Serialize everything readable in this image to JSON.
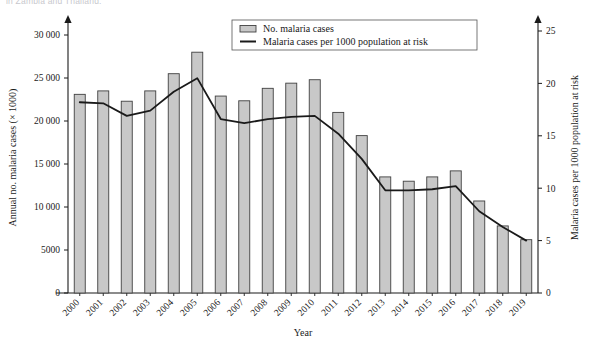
{
  "figure": {
    "cutoff_caption": "in Zambia and Thailand."
  },
  "chart_data": {
    "type": "bar",
    "title": "",
    "xlabel": "Year",
    "ylabel": "Annual no. malaria cases (× 1000)",
    "y2label": "Malaria cases per 1000 population at risk",
    "grid": false,
    "legend_position": "top-center",
    "categories": [
      "2000",
      "2001",
      "2002",
      "2003",
      "2004",
      "2005",
      "2006",
      "2007",
      "2008",
      "2009",
      "2010",
      "2011",
      "2012",
      "2013",
      "2014",
      "2015",
      "2016",
      "2017",
      "2018",
      "2019"
    ],
    "ylim": [
      0,
      30000
    ],
    "yticks": [
      0,
      5000,
      10000,
      15000,
      20000,
      25000,
      30000
    ],
    "ytick_labels": [
      "0",
      "5000",
      "10 000",
      "15 000",
      "20 000",
      "25 000",
      "30 000"
    ],
    "y2lim": [
      0,
      25
    ],
    "y2ticks": [
      0,
      5,
      10,
      15,
      20,
      25
    ],
    "y2tick_labels": [
      "0",
      "5",
      "10",
      "15",
      "20",
      "25"
    ],
    "series": [
      {
        "name": "No. malaria cases",
        "type": "bar",
        "axis": "left",
        "color": "#c8c8c8",
        "edge_color": "#404040",
        "values": [
          23100,
          23500,
          22300,
          23500,
          25500,
          28000,
          22900,
          22350,
          23800,
          24400,
          24800,
          21000,
          18300,
          13500,
          13000,
          13500,
          14200,
          10700,
          7800,
          6200
        ]
      },
      {
        "name": "Malaria cases per 1000 population at risk",
        "type": "line",
        "axis": "right",
        "color": "#1a1a1a",
        "values": [
          18.2,
          18.1,
          16.9,
          17.4,
          19.2,
          20.5,
          16.6,
          16.2,
          16.6,
          16.8,
          16.9,
          15.2,
          12.8,
          9.8,
          9.8,
          9.9,
          10.2,
          7.8,
          6.3,
          5.0
        ]
      }
    ]
  }
}
